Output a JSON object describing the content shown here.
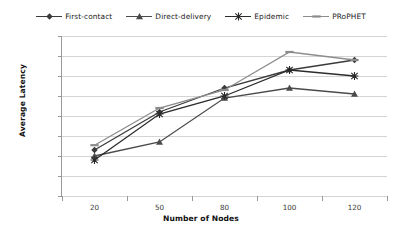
{
  "chart_data": {
    "type": "line",
    "title": "",
    "xlabel": "Number of Nodes",
    "ylabel": "Average Latency",
    "categories": [
      "20",
      "50",
      "80",
      "100",
      "120"
    ],
    "ylim": [
      0,
      4000
    ],
    "yticks": [
      0,
      500,
      1000,
      1500,
      2000,
      2500,
      3000,
      3500,
      4000
    ],
    "grid": true,
    "legend_position": "top",
    "series": [
      {
        "name": "First-contact",
        "marker": "diamond",
        "color": "#3a3a3a",
        "values": [
          1150,
          2100,
          2700,
          3150,
          3400
        ]
      },
      {
        "name": "Direct-delivery",
        "marker": "triangle",
        "color": "#4a4a4a",
        "values": [
          1000,
          1350,
          2450,
          2700,
          2550
        ]
      },
      {
        "name": "Epidemic",
        "marker": "cross",
        "color": "#2b2b2b",
        "values": [
          900,
          2050,
          2500,
          3150,
          3000
        ]
      },
      {
        "name": "PRoPHET",
        "marker": "dash",
        "color": "#8c8c8c",
        "values": [
          1270,
          2200,
          2650,
          3600,
          3400
        ]
      }
    ]
  }
}
